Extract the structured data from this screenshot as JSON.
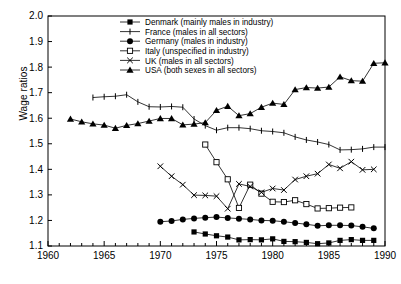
{
  "chart_data": {
    "type": "line",
    "title": "",
    "xlabel": "",
    "ylabel": "Wage ratios",
    "xlim": [
      1960,
      1990
    ],
    "ylim": [
      1.1,
      2.0
    ],
    "xticks": [
      1960,
      1965,
      1970,
      1975,
      1980,
      1985,
      1990
    ],
    "yticks": [
      1.1,
      1.2,
      1.3,
      1.4,
      1.5,
      1.6,
      1.7,
      1.8,
      1.9,
      2.0
    ],
    "xtick_labels": [
      "1960",
      "1965",
      "1970",
      "1975",
      "1980",
      "1985",
      "1990"
    ],
    "ytick_labels": [
      "1.1",
      "1.2",
      "1.3",
      "1.4",
      "1.5",
      "1.6",
      "1.7",
      "1.8",
      "1.9",
      "2.0"
    ],
    "x_minor_tick_step": 1,
    "grid": false,
    "legend_position": "top-center",
    "series": [
      {
        "name": "Denmark (mainly males in industry)",
        "marker": "filled-square",
        "color": "#000000",
        "x": [
          1973,
          1974,
          1975,
          1976,
          1977,
          1978,
          1979,
          1980,
          1981,
          1982,
          1983,
          1984,
          1985,
          1986,
          1987,
          1988,
          1989
        ],
        "values": [
          1.155,
          1.147,
          1.14,
          1.135,
          1.124,
          1.125,
          1.124,
          1.128,
          1.118,
          1.117,
          1.114,
          1.109,
          1.112,
          1.122,
          1.125,
          1.122,
          1.122
        ]
      },
      {
        "name": "France (males in all sectors)",
        "marker": "plus",
        "color": "#000000",
        "x": [
          1964,
          1965,
          1966,
          1967,
          1968,
          1969,
          1970,
          1971,
          1972,
          1973,
          1974,
          1975,
          1976,
          1977,
          1978,
          1979,
          1980,
          1981,
          1982,
          1983,
          1984,
          1985,
          1986,
          1987,
          1988,
          1989,
          1990
        ],
        "values": [
          1.681,
          1.684,
          1.686,
          1.692,
          1.664,
          1.645,
          1.644,
          1.646,
          1.643,
          1.597,
          1.571,
          1.553,
          1.563,
          1.563,
          1.559,
          1.551,
          1.548,
          1.543,
          1.527,
          1.515,
          1.507,
          1.497,
          1.476,
          1.477,
          1.48,
          1.487,
          1.487
        ]
      },
      {
        "name": "Germany (males in industry)",
        "marker": "filled-circle",
        "color": "#000000",
        "x": [
          1970,
          1971,
          1972,
          1973,
          1974,
          1975,
          1976,
          1977,
          1978,
          1979,
          1980,
          1981,
          1982,
          1983,
          1984,
          1985,
          1986,
          1987,
          1988,
          1989
        ],
        "values": [
          1.195,
          1.198,
          1.204,
          1.208,
          1.211,
          1.213,
          1.21,
          1.207,
          1.204,
          1.2,
          1.199,
          1.195,
          1.19,
          1.185,
          1.179,
          1.181,
          1.181,
          1.18,
          1.175,
          1.169
        ]
      },
      {
        "name": "Italy (unspecified in industry)",
        "marker": "open-square",
        "color": "#000000",
        "x": [
          1974,
          1975,
          1976,
          1977,
          1978,
          1979,
          1980,
          1981,
          1982,
          1983,
          1984,
          1985,
          1986,
          1987
        ],
        "values": [
          1.497,
          1.428,
          1.361,
          1.249,
          1.34,
          1.305,
          1.273,
          1.272,
          1.279,
          1.264,
          1.247,
          1.248,
          1.25,
          1.251
        ]
      },
      {
        "name": "UK (males in all sectors)",
        "marker": "cross",
        "color": "#000000",
        "x": [
          1970,
          1971,
          1972,
          1973,
          1974,
          1975,
          1976,
          1977,
          1978,
          1979,
          1980,
          1981,
          1982,
          1983,
          1984,
          1985,
          1986,
          1987,
          1988,
          1989
        ],
        "values": [
          1.412,
          1.373,
          1.34,
          1.299,
          1.298,
          1.295,
          1.246,
          1.343,
          1.333,
          1.31,
          1.325,
          1.319,
          1.36,
          1.373,
          1.383,
          1.419,
          1.404,
          1.43,
          1.398,
          1.4
        ]
      },
      {
        "name": "USA (both sexes in all sectors)",
        "marker": "filled-triangle",
        "color": "#000000",
        "x": [
          1962,
          1963,
          1964,
          1965,
          1966,
          1967,
          1968,
          1969,
          1970,
          1971,
          1972,
          1973,
          1974,
          1975,
          1976,
          1977,
          1978,
          1979,
          1980,
          1981,
          1982,
          1983,
          1984,
          1985,
          1986,
          1987,
          1988,
          1989,
          1990
        ],
        "values": [
          1.597,
          1.586,
          1.578,
          1.573,
          1.561,
          1.572,
          1.579,
          1.589,
          1.599,
          1.599,
          1.574,
          1.577,
          1.583,
          1.631,
          1.647,
          1.61,
          1.618,
          1.643,
          1.659,
          1.654,
          1.712,
          1.72,
          1.718,
          1.722,
          1.762,
          1.747,
          1.745,
          1.815,
          1.817
        ]
      }
    ],
    "legend_entries": [
      "Denmark (mainly males in industry)",
      "France (males in all sectors)",
      "Germany (males in industry)",
      "Italy (unspecified in industry)",
      "UK (males in all sectors)",
      "USA (both sexes in all sectors)"
    ]
  }
}
